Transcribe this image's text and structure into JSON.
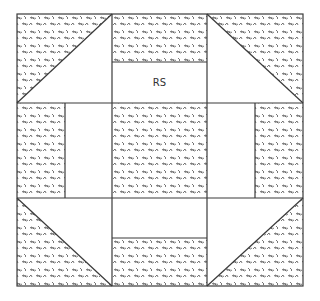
{
  "diagram": {
    "type": "quilt-block",
    "name": "Churn Dash",
    "grid": "3x3",
    "label": "RS",
    "colors": {
      "line": "#3a3a3a",
      "background": "#ffffff",
      "print_motif": "#555555"
    },
    "cells": [
      {
        "pos": "top-left",
        "kind": "half-square-triangle",
        "print_half": "upper-left"
      },
      {
        "pos": "top-center",
        "kind": "two-strip",
        "print_side": "top"
      },
      {
        "pos": "top-right",
        "kind": "half-square-triangle",
        "print_half": "upper-right"
      },
      {
        "pos": "middle-left",
        "kind": "two-strip",
        "print_side": "left"
      },
      {
        "pos": "center",
        "kind": "print-square"
      },
      {
        "pos": "middle-right",
        "kind": "two-strip",
        "print_side": "right"
      },
      {
        "pos": "bottom-left",
        "kind": "half-square-triangle",
        "print_half": "lower-left"
      },
      {
        "pos": "bottom-center",
        "kind": "two-strip",
        "print_side": "bottom"
      },
      {
        "pos": "bottom-right",
        "kind": "half-square-triangle",
        "print_half": "lower-right"
      }
    ]
  }
}
